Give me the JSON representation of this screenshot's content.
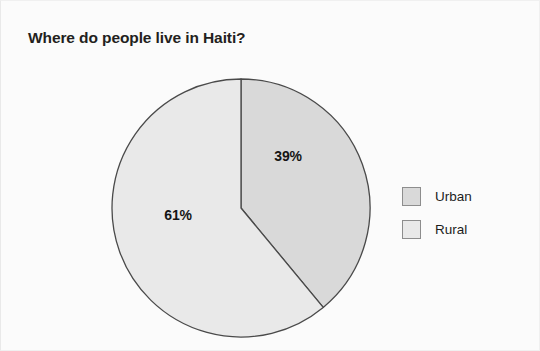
{
  "page": {
    "background_color": "#fbfbfb",
    "width": 540,
    "height": 351
  },
  "title": "Where do people live in Haiti?",
  "legend": {
    "position": "right",
    "items": [
      {
        "label": "Urban",
        "color": "#d9d9d9"
      },
      {
        "label": "Rural",
        "color": "#e9e9e9"
      }
    ]
  },
  "labels": {
    "urban": "39%",
    "rural": "61%"
  },
  "chart_data": {
    "type": "pie",
    "title": "Where do people live in Haiti?",
    "xlabel": "",
    "ylabel": "",
    "unit": "percent",
    "start_angle_deg": 0,
    "direction": "clockwise",
    "legend_position": "right",
    "grid": false,
    "categories": [
      "Urban",
      "Rural"
    ],
    "values": [
      39,
      61
    ],
    "data_labels": [
      "39%",
      "61%"
    ],
    "colors": [
      "#d9d9d9",
      "#e9e9e9"
    ],
    "slice_stroke": "#4a4a4a",
    "slices": [
      {
        "name": "Urban",
        "value": 39,
        "label": "39%",
        "color": "#d9d9d9",
        "angle_deg": 140.4
      },
      {
        "name": "Rural",
        "value": 61,
        "label": "61%",
        "color": "#e9e9e9",
        "angle_deg": 219.6
      }
    ]
  }
}
